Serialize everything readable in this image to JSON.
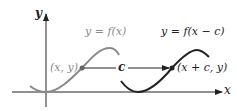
{
  "diagram": {
    "axes": {
      "x_label": "x",
      "y_label": "y"
    },
    "original_curve": {
      "label": "y = f(x)",
      "point_label": "(x, y)",
      "color": "#8a8a8a"
    },
    "shifted_curve": {
      "label": "y = f(x − c)",
      "point_label": "(x + c, y)",
      "color": "#222222"
    },
    "shift_arrow": {
      "label": "c"
    },
    "colors": {
      "axis": "#222222",
      "background": "#ffffff"
    }
  }
}
